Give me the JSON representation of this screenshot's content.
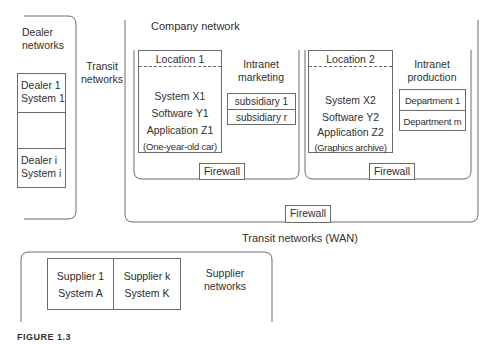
{
  "dealer_networks": {
    "title_line1": "Dealer",
    "title_line2": "networks",
    "entries": [
      {
        "line1": "Dealer 1",
        "line2": "System 1"
      },
      {
        "line1": "",
        "line2": ""
      },
      {
        "line1": "Dealer i",
        "line2": "System i"
      }
    ]
  },
  "transit_networks": {
    "line1": "Transit",
    "line2": "networks"
  },
  "company_network": {
    "title": "Company network",
    "firewall": "Firewall",
    "intranet_marketing": {
      "title_line1": "Intranet",
      "title_line2": "marketing",
      "firewall": "Firewall",
      "location": {
        "title": "Location 1",
        "lines": [
          "System X1",
          "Software Y1",
          "Application Z1",
          "(One-year-old car)"
        ]
      },
      "subsidiaries": [
        "subsidiary 1",
        "subsidiary r"
      ]
    },
    "intranet_production": {
      "title_line1": "Intranet",
      "title_line2": "production",
      "firewall": "Firewall",
      "location": {
        "title": "Location 2",
        "lines": [
          "System X2",
          "Software Y2",
          "Application Z2",
          "(Graphics archive)"
        ]
      },
      "departments": [
        "Department 1",
        "Department m"
      ]
    }
  },
  "transit_wan": "Transit networks (WAN)",
  "supplier_networks": {
    "title_line1": "Supplier",
    "title_line2": "networks",
    "entries": [
      {
        "line1": "Supplier 1",
        "line2": "System A"
      },
      {
        "line1": "Supplier k",
        "line2": "System K"
      }
    ]
  },
  "caption_partial": "FIGURE 1.3"
}
